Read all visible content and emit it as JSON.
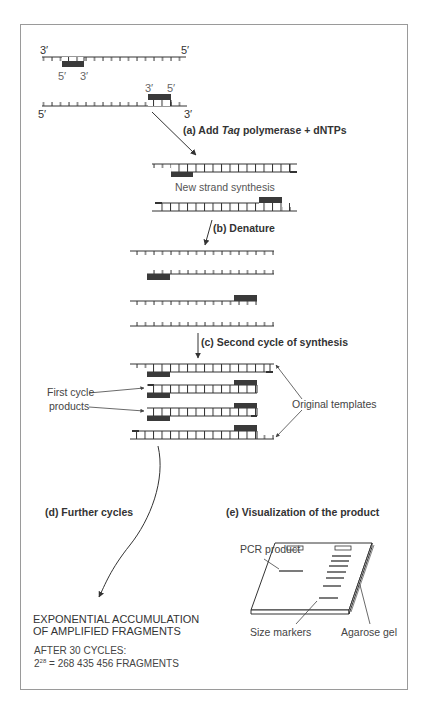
{
  "figure": {
    "initial_strands": {
      "top": {
        "left_end": "3′",
        "right_end": "5′",
        "primer_left": "5′",
        "primer_right": "3′"
      },
      "bottom": {
        "left_end": "5′",
        "right_end": "3′",
        "primer_left": "3′",
        "primer_right": "5′"
      }
    },
    "steps": {
      "a": {
        "prefix": "(a)  Add ",
        "italic": "Taq",
        "suffix": " polymerase + dNTPs"
      },
      "a_caption": "New strand synthesis",
      "b": "(b)  Denature",
      "c": "(c)  Second cycle of synthesis",
      "d": "(d)  Further cycles",
      "e": "(e)  Visualization of the product"
    },
    "annotations": {
      "first_cycle_line1": "First cycle",
      "first_cycle_line2": "products",
      "original_templates": "Original templates",
      "pcr_product": "PCR product",
      "size_markers": "Size markers",
      "agarose_gel": "Agarose gel"
    },
    "result": {
      "line1": "EXPONENTIAL ACCUMULATION",
      "line2": "OF AMPLIFIED FRAGMENTS",
      "line3": "AFTER 30 CYCLES:",
      "base": "2",
      "exponent": "28",
      "equation_rest": " = 268 435 456 FRAGMENTS"
    },
    "colors": {
      "strand": "#333333",
      "primer": "#3a3a3a",
      "frame": "#9a9a9a"
    }
  }
}
